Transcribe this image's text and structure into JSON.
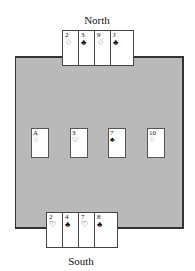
{
  "players": {
    "north": {
      "label": "North",
      "cards": [
        {
          "rank": "2",
          "suit": "♢",
          "suit_name": "diamonds"
        },
        {
          "rank": "3",
          "suit": "♣",
          "suit_name": "clubs"
        },
        {
          "rank": "9",
          "suit": "♢",
          "suit_name": "diamonds"
        },
        {
          "rank": "J",
          "suit": "♣",
          "suit_name": "clubs"
        }
      ]
    },
    "south": {
      "label": "South",
      "cards": [
        {
          "rank": "2",
          "suit": "♡",
          "suit_name": "hearts"
        },
        {
          "rank": "4",
          "suit": "♣",
          "suit_name": "clubs"
        },
        {
          "rank": "7",
          "suit": "♡",
          "suit_name": "hearts"
        },
        {
          "rank": "8",
          "suit": "♣",
          "suit_name": "clubs"
        }
      ]
    }
  },
  "table": {
    "color": "#b9b9b9",
    "center_cards": [
      {
        "rank": "A",
        "suit": "♢",
        "suit_name": "diamonds"
      },
      {
        "rank": "3",
        "suit": "♡",
        "suit_name": "hearts"
      },
      {
        "rank": "7",
        "suit": "♣",
        "suit_name": "clubs"
      },
      {
        "rank": "10",
        "suit": "♢",
        "suit_name": "diamonds"
      }
    ]
  }
}
